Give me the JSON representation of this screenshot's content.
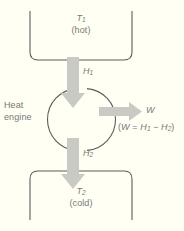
{
  "figure": {
    "background_color": "#fffff3",
    "outline_color": "#5b5d5e",
    "arrow_color": "#c9cac4",
    "text_color": "#77797a"
  },
  "hot_reservoir": {
    "symbol": "T",
    "subscript": "1",
    "state": "(hot)"
  },
  "cold_reservoir": {
    "symbol": "T",
    "subscript": "2",
    "state": "(cold)"
  },
  "engine": {
    "label_line1": "Heat",
    "label_line2": "engine"
  },
  "flows": {
    "heat_in": {
      "symbol": "H",
      "subscript": "1"
    },
    "heat_out": {
      "symbol": "H",
      "subscript": "2"
    },
    "work": {
      "symbol": "W"
    }
  },
  "equation": {
    "open": "(",
    "work": "W",
    "equals": "=",
    "heat_in": "H",
    "heat_in_sub": "1",
    "minus": "−",
    "heat_out": "H",
    "heat_out_sub": "2",
    "close": ")",
    "plain": "(W = H1 − H2)"
  }
}
